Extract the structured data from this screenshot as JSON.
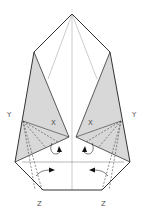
{
  "diagram": {
    "type": "origami-fold-step",
    "labels": {
      "y_left": "Y",
      "y_right": "Y",
      "x_left": "X",
      "x_right": "X",
      "z_left": "Z",
      "z_right": "Z"
    },
    "colors": {
      "outline": "#333333",
      "shaded_flap": "#d8d8d8",
      "crease_line": "#aaaaaa",
      "dashed_fold": "#444444",
      "arrow": "#111111"
    }
  }
}
